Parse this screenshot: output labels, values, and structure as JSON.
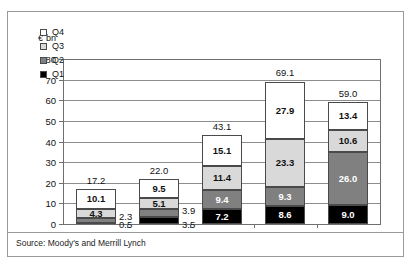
{
  "figure": {
    "unit_label": "€ bn",
    "source": "Source: Moody's and Merrill Lynch"
  },
  "colors": {
    "q1": "#000000",
    "q2": "#808080",
    "q3": "#d9d9d9",
    "q4": "#ffffff",
    "axis": "#6f6f6f",
    "grid": "#8d8d8d",
    "border": "#9a9a9a"
  },
  "legend": {
    "items": [
      {
        "label": "Q4",
        "color": "#ffffff"
      },
      {
        "label": "Q3",
        "color": "#d9d9d9"
      },
      {
        "label": "Q2",
        "color": "#808080"
      },
      {
        "label": "Q1",
        "color": "#000000"
      }
    ]
  },
  "chart_data": {
    "type": "bar",
    "stacked": true,
    "title": "",
    "subtitle": "",
    "xlabel": "",
    "ylabel": "€ bn",
    "ylim": [
      0,
      80
    ],
    "yticks": [
      0,
      10,
      20,
      30,
      40,
      50,
      60,
      70,
      80
    ],
    "ytick_labels": [
      "0",
      "10",
      "20",
      "30",
      "40",
      "50",
      "60",
      "70",
      "80"
    ],
    "grid": true,
    "legend_position": "upper-left-inside",
    "categories": [
      "2003",
      "2004",
      "2005",
      "2006",
      "2007"
    ],
    "series": [
      {
        "name": "Q1",
        "color": "#000000",
        "values": [
          0.5,
          3.5,
          7.2,
          8.6,
          9.0
        ]
      },
      {
        "name": "Q2",
        "color": "#808080",
        "values": [
          2.3,
          3.9,
          9.4,
          9.3,
          26.0
        ]
      },
      {
        "name": "Q3",
        "color": "#d9d9d9",
        "values": [
          4.3,
          5.1,
          11.4,
          23.3,
          10.6
        ]
      },
      {
        "name": "Q4",
        "color": "#ffffff",
        "values": [
          10.1,
          9.5,
          15.1,
          27.9,
          13.4
        ]
      }
    ],
    "totals": [
      17.2,
      22.0,
      43.1,
      69.1,
      59.0
    ],
    "total_labels": [
      "17.2",
      "22.0",
      "43.1",
      "69.1",
      "59.0"
    ],
    "segment_labels": {
      "2003": {
        "Q1": "0.5",
        "Q2": "2.3",
        "Q3": "4.3",
        "Q4": "10.1"
      },
      "2004": {
        "Q1": "3.5",
        "Q2": "3.9",
        "Q3": "5.1",
        "Q4": "9.5"
      },
      "2005": {
        "Q1": "7.2",
        "Q2": "9.4",
        "Q3": "11.4",
        "Q4": "15.1"
      },
      "2006": {
        "Q1": "8.6",
        "Q2": "9.3",
        "Q3": "23.3",
        "Q4": "27.9"
      },
      "2007": {
        "Q1": "9.0",
        "Q2": "26.0",
        "Q3": "10.6",
        "Q4": "13.4"
      }
    }
  }
}
